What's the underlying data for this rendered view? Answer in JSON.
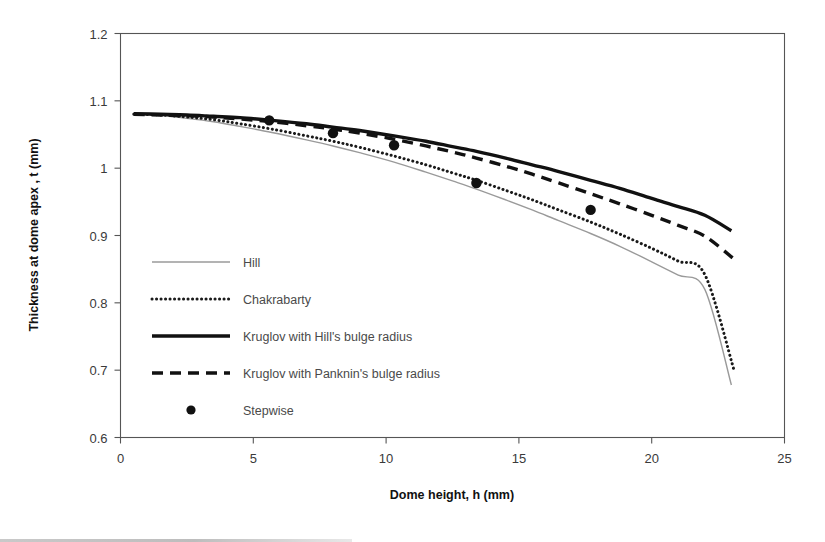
{
  "chart_data": {
    "type": "line",
    "title": "",
    "xlabel": "Dome height, h (mm)",
    "ylabel": "Thickness at dome apex , t (mm)",
    "xlim": [
      0,
      25
    ],
    "ylim": [
      0.6,
      1.2
    ],
    "xticks": [
      0,
      5,
      10,
      15,
      20,
      25
    ],
    "xtick_labels": [
      "0",
      "5",
      "10",
      "15",
      "20",
      "25"
    ],
    "yticks": [
      0.6,
      0.7,
      0.8,
      0.9,
      1.0,
      1.1,
      1.2
    ],
    "ytick_labels": [
      "0.6",
      "0.7",
      "0.8",
      "0.9",
      "1",
      "1.1",
      "1.2"
    ],
    "grid": false,
    "legend_position": "inside-lower-left",
    "series": [
      {
        "name": "Hill",
        "style": "solid-thin",
        "color": "#9a9a9a",
        "x": [
          0.5,
          1.5,
          2.5,
          3.5,
          4.5,
          5.7,
          7.0,
          8.0,
          9.0,
          10.3,
          11.5,
          12.5,
          13.4,
          14.5,
          15.5,
          16.5,
          17.7,
          18.8,
          20.0,
          21.0,
          22.0,
          23.0
        ],
        "y": [
          1.08,
          1.078,
          1.074,
          1.069,
          1.062,
          1.053,
          1.042,
          1.033,
          1.023,
          1.009,
          0.994,
          0.981,
          0.969,
          0.953,
          0.938,
          0.922,
          0.903,
          0.884,
          0.861,
          0.841,
          0.82,
          0.678
        ]
      },
      {
        "name": "Chakrabarty",
        "style": "dotted",
        "color": "#1a1a1a",
        "x": [
          0.5,
          1.5,
          2.5,
          3.5,
          4.5,
          5.7,
          7.0,
          8.0,
          9.0,
          10.3,
          11.5,
          12.5,
          13.4,
          14.5,
          15.5,
          16.5,
          17.7,
          18.8,
          20.0,
          21.0,
          22.0,
          23.1
        ],
        "y": [
          1.08,
          1.079,
          1.076,
          1.072,
          1.066,
          1.058,
          1.048,
          1.04,
          1.031,
          1.018,
          1.005,
          0.993,
          0.982,
          0.967,
          0.953,
          0.938,
          0.92,
          0.902,
          0.881,
          0.862,
          0.842,
          0.7
        ]
      },
      {
        "name": "Kruglov with Hill's bulge radius",
        "style": "solid-thick",
        "color": "#111111",
        "x": [
          0.5,
          1.5,
          2.5,
          3.5,
          4.5,
          5.7,
          7.0,
          8.0,
          9.0,
          10.3,
          11.5,
          12.5,
          13.4,
          14.5,
          15.5,
          16.5,
          17.7,
          18.8,
          20.0,
          21.0,
          22.0,
          23.0
        ],
        "y": [
          1.081,
          1.08,
          1.079,
          1.077,
          1.075,
          1.071,
          1.066,
          1.061,
          1.056,
          1.048,
          1.04,
          1.032,
          1.025,
          1.015,
          1.005,
          0.995,
          0.982,
          0.97,
          0.955,
          0.943,
          0.93,
          0.907
        ]
      },
      {
        "name": "Kruglov with Panknin's bulge radius",
        "style": "dashed",
        "color": "#111111",
        "x": [
          0.5,
          1.5,
          2.5,
          3.5,
          4.5,
          5.7,
          7.0,
          8.0,
          9.0,
          10.3,
          11.5,
          12.5,
          13.4,
          14.5,
          15.5,
          16.5,
          17.7,
          18.8,
          20.0,
          21.0,
          22.0,
          23.1
        ],
        "y": [
          1.08,
          1.079,
          1.078,
          1.076,
          1.073,
          1.069,
          1.063,
          1.058,
          1.052,
          1.043,
          1.033,
          1.024,
          1.015,
          1.003,
          0.991,
          0.978,
          0.962,
          0.947,
          0.93,
          0.915,
          0.899,
          0.865
        ]
      },
      {
        "name": "Stepwise",
        "style": "marker",
        "color": "#111111",
        "x": [
          5.6,
          8.0,
          10.3,
          13.4,
          17.7
        ],
        "y": [
          1.071,
          1.052,
          1.034,
          0.978,
          0.938
        ]
      }
    ],
    "legend": [
      {
        "label": "Hill",
        "style": "solid-thin",
        "color": "#9a9a9a"
      },
      {
        "label": "Chakrabarty",
        "style": "dotted",
        "color": "#1a1a1a"
      },
      {
        "label": "Kruglov with Hill's bulge radius",
        "style": "solid-thick",
        "color": "#111111"
      },
      {
        "label": "Kruglov with Panknin's bulge radius",
        "style": "dashed",
        "color": "#111111"
      },
      {
        "label": "Stepwise",
        "style": "marker",
        "color": "#111111"
      }
    ]
  }
}
